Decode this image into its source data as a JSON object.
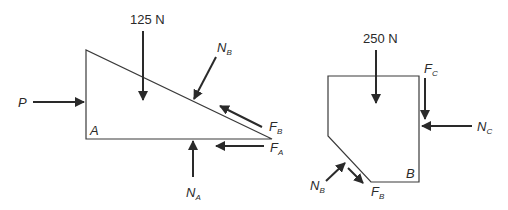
{
  "diagram": {
    "type": "free-body-diagram",
    "left_body": {
      "name": "wedge",
      "shape": "right triangle",
      "corner_label": "A",
      "forces": [
        {
          "id": "applied_load",
          "label": "125 N",
          "direction": "down"
        },
        {
          "id": "P",
          "label": "P",
          "subscript": "",
          "direction": "right"
        },
        {
          "id": "N_B",
          "label": "N",
          "subscript": "B",
          "direction": "normal into inclined face"
        },
        {
          "id": "F_B",
          "label": "F",
          "subscript": "B",
          "direction": "up-left along inclined face"
        },
        {
          "id": "F_A",
          "label": "F",
          "subscript": "A",
          "direction": "left"
        },
        {
          "id": "N_A",
          "label": "N",
          "subscript": "A",
          "direction": "up"
        }
      ]
    },
    "right_body": {
      "name": "block",
      "shape": "pentagon with chamfered lower-left corner",
      "corner_label": "B",
      "forces": [
        {
          "id": "applied_load",
          "label": "250 N",
          "direction": "down"
        },
        {
          "id": "F_C",
          "label": "F",
          "subscript": "C",
          "direction": "down"
        },
        {
          "id": "N_C",
          "label": "N",
          "subscript": "C",
          "direction": "left"
        },
        {
          "id": "N_B",
          "label": "N",
          "subscript": "B",
          "direction": "up-right into chamfer"
        },
        {
          "id": "F_B",
          "label": "F",
          "subscript": "B",
          "direction": "down-right along chamfer"
        }
      ]
    },
    "colors": {
      "stroke": "#2a2a2a",
      "background": "#ffffff"
    }
  }
}
